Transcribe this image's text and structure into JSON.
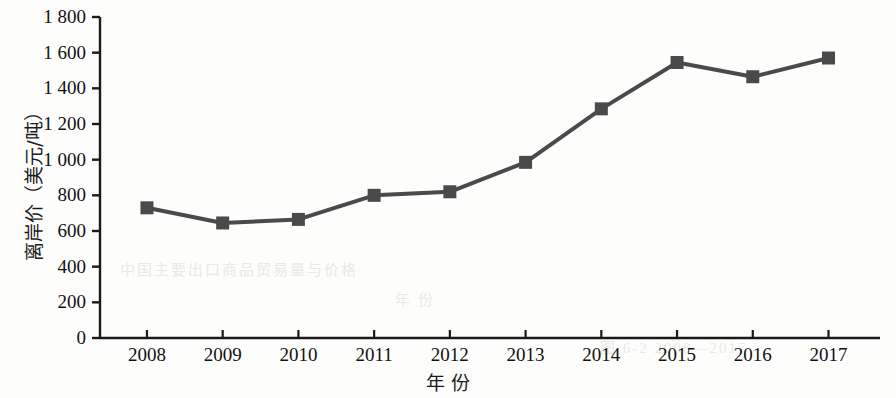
{
  "chart_data": {
    "type": "line",
    "title": "",
    "xlabel": "年 份",
    "ylabel": "离岸价（美元/吨）",
    "categories": [
      "2008",
      "2009",
      "2010",
      "2011",
      "2012",
      "2013",
      "2014",
      "2015",
      "2016",
      "2017"
    ],
    "values": [
      730,
      645,
      665,
      800,
      820,
      985,
      1285,
      1545,
      1465,
      1570
    ],
    "series": [
      {
        "name": "离岸价",
        "values": [
          730,
          645,
          665,
          800,
          820,
          985,
          1285,
          1545,
          1465,
          1570
        ]
      }
    ],
    "ylim": [
      0,
      1800
    ],
    "ytick_labels": [
      "0",
      "200",
      "400",
      "600",
      "800",
      "1 000",
      "1 200",
      "1 400",
      "1 600",
      "1 800"
    ],
    "ytick_values": [
      0,
      200,
      400,
      600,
      800,
      1000,
      1200,
      1400,
      1600,
      1800
    ],
    "grid": false,
    "legend": "none",
    "marker": "square",
    "line_color": "#4a4a4a",
    "marker_color": "#4a4a4a",
    "axis_color": "#1a1a1a"
  },
  "ghost_text": {
    "row1": "中国主要出口商品贸易量与价格",
    "row2": "年 份",
    "row3": "图 6-2  2008—2017"
  }
}
